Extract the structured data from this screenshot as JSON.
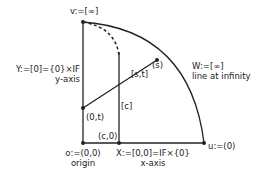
{
  "diagram": {
    "points": {
      "v": {
        "label": "v:=[∞]"
      },
      "o": {
        "label": "o:=(0,0)",
        "caption": "origin"
      },
      "u": {
        "label": "u:=(0)"
      },
      "s": {
        "label": "(s)"
      },
      "zero_t": {
        "label": "(0,t)"
      },
      "c_zero": {
        "label": "(c,0)"
      }
    },
    "lines": {
      "y_axis": {
        "label": "Y:=[0]={0}×IF",
        "caption": "y-axis"
      },
      "x_axis": {
        "label": "X:=[0,0]=IF×{0}",
        "caption": "x-axis"
      },
      "infinity": {
        "label": "W:=[∞]",
        "caption": "line at infinity"
      },
      "st": {
        "label": "[s,t]"
      },
      "c": {
        "label": "[c]"
      }
    },
    "colors": {
      "stroke": "#222222",
      "background": "#ffffff"
    }
  }
}
